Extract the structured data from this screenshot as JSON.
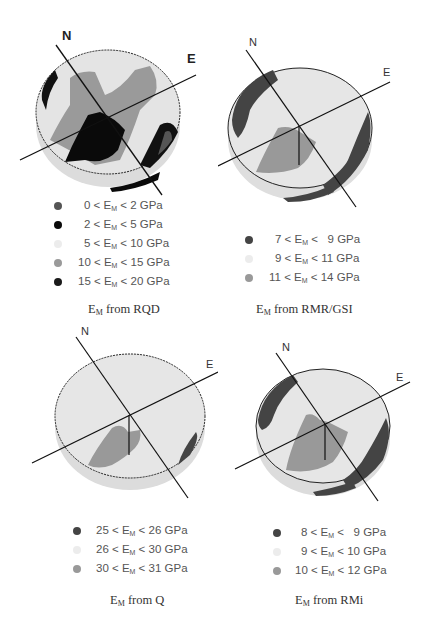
{
  "figure": {
    "panels": [
      {
        "id": "rqd",
        "caption_prefix": "E",
        "caption_sub": "M",
        "caption_suffix": " from RQD",
        "north_label": "N",
        "east_label": "E",
        "legend": [
          {
            "low": "0",
            "high": "2",
            "unit": "GPa",
            "color": "#555555"
          },
          {
            "low": "2",
            "high": "5",
            "unit": "GPa",
            "color": "#0a0a0a"
          },
          {
            "low": "5",
            "high": "10",
            "unit": "GPa",
            "color": "#e6e6e6"
          },
          {
            "low": "10",
            "high": "15",
            "unit": "GPa",
            "color": "#9a9a9a"
          },
          {
            "low": "15",
            "high": "20",
            "unit": "GPa",
            "color": "#1a1a1a"
          }
        ]
      },
      {
        "id": "rmr_gsi",
        "caption_prefix": "E",
        "caption_sub": "M",
        "caption_suffix": " from RMR/GSI",
        "north_label": "N",
        "east_label": "E",
        "legend": [
          {
            "low": "7",
            "high": "9",
            "unit": "GPa",
            "color": "#444444"
          },
          {
            "low": "9",
            "high": "11",
            "unit": "GPa",
            "color": "#e6e6e6"
          },
          {
            "low": "11",
            "high": "14",
            "unit": "GPa",
            "color": "#999999"
          }
        ]
      },
      {
        "id": "q",
        "caption_prefix": "E",
        "caption_sub": "M",
        "caption_suffix": " from Q",
        "north_label": "N",
        "east_label": "E",
        "legend": [
          {
            "low": "25",
            "high": "26",
            "unit": "GPa",
            "color": "#444444"
          },
          {
            "low": "26",
            "high": "30",
            "unit": "GPa",
            "color": "#e6e6e6"
          },
          {
            "low": "30",
            "high": "31",
            "unit": "GPa",
            "color": "#999999"
          }
        ]
      },
      {
        "id": "rmi",
        "caption_prefix": "E",
        "caption_sub": "M",
        "caption_suffix": " from RMi",
        "north_label": "N",
        "east_label": "E",
        "legend": [
          {
            "low": "8",
            "high": "9",
            "unit": "GPa",
            "color": "#444444"
          },
          {
            "low": "9",
            "high": "10",
            "unit": "GPa",
            "color": "#e6e6e6"
          },
          {
            "low": "10",
            "high": "12",
            "unit": "GPa",
            "color": "#999999"
          }
        ]
      }
    ],
    "symbol": "<",
    "variable": "E",
    "variable_sub": "M"
  }
}
